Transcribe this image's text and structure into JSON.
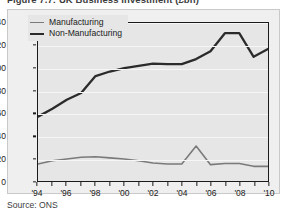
{
  "figure": {
    "title": "Figure 7.7: UK Business Investment (£bn)",
    "source": "Source: ONS"
  },
  "legend": {
    "position": "top-left",
    "items": [
      {
        "label": "Manufacturing",
        "color": "#7a7a7a",
        "swatch": "line-swatch-thin"
      },
      {
        "label": "Non-Manufacturing",
        "color": "#2b2b2b",
        "swatch": "line-swatch-thick"
      }
    ]
  },
  "axes": {
    "y_ticks": [
      "0",
      "20",
      "40",
      "60",
      "80",
      "100",
      "120",
      "140"
    ],
    "x_ticks": [
      "'94",
      "'96",
      "'98",
      "'00",
      "'02",
      "'04",
      "'06",
      "'08",
      "'10"
    ]
  },
  "colors": {
    "manufacturing": "#7a7a7a",
    "non_manufacturing": "#2b2b2b",
    "plot_background": "#e6e6e6",
    "figure_background": "#efefef",
    "gridline": "#f6f6f6",
    "axis": "#1b1b1b"
  },
  "chart_data": {
    "type": "line",
    "title": "Figure 7.7: UK Business Investment (£bn)",
    "xlabel": "",
    "ylabel": "",
    "ylim": [
      0,
      140
    ],
    "ytick_step": 20,
    "grid": true,
    "legend_position": "top-left",
    "x": [
      1994,
      1995,
      1996,
      1997,
      1998,
      1999,
      2000,
      2001,
      2002,
      2003,
      2004,
      2005,
      2006,
      2007,
      2008,
      2009,
      2010
    ],
    "x_tick_labels": [
      "'94",
      "'96",
      "'98",
      "'00",
      "'02",
      "'04",
      "'06",
      "'08",
      "'10"
    ],
    "x_tick_values": [
      1994,
      1996,
      1998,
      2000,
      2002,
      2004,
      2006,
      2008,
      2010
    ],
    "series": [
      {
        "name": "Manufacturing",
        "color": "#7a7a7a",
        "values": [
          15,
          18,
          19.5,
          21,
          21.5,
          20.5,
          19.5,
          18,
          16,
          15,
          15,
          31,
          14.5,
          15.5,
          15.5,
          13,
          13
        ]
      },
      {
        "name": "Non-Manufacturing",
        "color": "#2b2b2b",
        "values": [
          57,
          64,
          72,
          78,
          93,
          97,
          100,
          102,
          104,
          103.5,
          103.5,
          108,
          115,
          131,
          131,
          110,
          117
        ]
      }
    ],
    "units": "£bn",
    "source": "ONS"
  }
}
